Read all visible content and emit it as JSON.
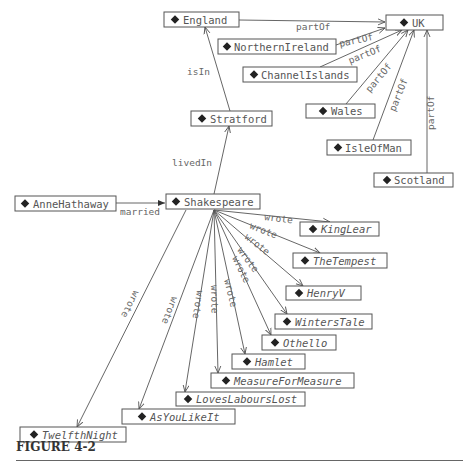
{
  "caption": "FIGURE 4-2",
  "nodes": {
    "england": {
      "label": "England",
      "x": 164,
      "y": 12,
      "w": 75,
      "h": 15
    },
    "uk": {
      "label": "UK",
      "x": 386,
      "y": 15,
      "w": 57,
      "h": 15
    },
    "northernireland": {
      "label": "NorthernIreland",
      "x": 218,
      "y": 39,
      "w": 118,
      "h": 15
    },
    "channelislands": {
      "label": "ChannelIslands",
      "x": 243,
      "y": 67,
      "w": 114,
      "h": 15
    },
    "wales": {
      "label": "Wales",
      "x": 306,
      "y": 104,
      "w": 69,
      "h": 14
    },
    "isleofman": {
      "label": "IsleOfMan",
      "x": 327,
      "y": 140,
      "w": 84,
      "h": 15
    },
    "scotland": {
      "label": "Scotland",
      "x": 374,
      "y": 173,
      "w": 79,
      "h": 14
    },
    "stratford": {
      "label": "Stratford",
      "x": 191,
      "y": 111,
      "w": 81,
      "h": 15
    },
    "annehathaway": {
      "label": "AnneHathaway",
      "x": 15,
      "y": 196,
      "w": 101,
      "h": 15
    },
    "shakespeare": {
      "label": "Shakespeare",
      "x": 166,
      "y": 194,
      "w": 94,
      "h": 15
    },
    "kinglear": {
      "label": "KingLear",
      "x": 300,
      "y": 222,
      "w": 79,
      "h": 14
    },
    "thetempest": {
      "label": "TheTempest",
      "x": 293,
      "y": 253,
      "w": 94,
      "h": 15
    },
    "henryv": {
      "label": "HenryV",
      "x": 286,
      "y": 286,
      "w": 75,
      "h": 14
    },
    "winterstale": {
      "label": "WintersTale",
      "x": 275,
      "y": 314,
      "w": 97,
      "h": 15
    },
    "othello": {
      "label": "Othello",
      "x": 262,
      "y": 335,
      "w": 74,
      "h": 15
    },
    "hamlet": {
      "label": "Hamlet",
      "x": 232,
      "y": 354,
      "w": 73,
      "h": 15
    },
    "measureformeasure": {
      "label": "MeasureForMeasure",
      "x": 211,
      "y": 373,
      "w": 143,
      "h": 15
    },
    "loveslabourslost": {
      "label": "LovesLaboursLost",
      "x": 176,
      "y": 392,
      "w": 129,
      "h": 14
    },
    "asyoulikeit": {
      "label": "AsYouLikeIt",
      "x": 122,
      "y": 409,
      "w": 113,
      "h": 15
    },
    "twelfthnight": {
      "label": "TwelfthNight",
      "x": 20,
      "y": 427,
      "w": 106,
      "h": 15
    }
  },
  "edges": [
    {
      "from": "england",
      "to": "uk",
      "label": "partOf"
    },
    {
      "from": "northernireland",
      "to": "uk",
      "label": "partOf"
    },
    {
      "from": "channelislands",
      "to": "uk",
      "label": "partOf"
    },
    {
      "from": "wales",
      "to": "uk",
      "label": "partOf"
    },
    {
      "from": "isleofman",
      "to": "uk",
      "label": "partOf"
    },
    {
      "from": "scotland",
      "to": "uk",
      "label": "partOf"
    },
    {
      "from": "stratford",
      "to": "england",
      "label": "isIn"
    },
    {
      "from": "shakespeare",
      "to": "stratford",
      "label": "livedIn"
    },
    {
      "from": "annehathaway",
      "to": "shakespeare",
      "label": "married"
    },
    {
      "from": "shakespeare",
      "to": "kinglear",
      "label": "wrote"
    },
    {
      "from": "shakespeare",
      "to": "thetempest",
      "label": "wrote"
    },
    {
      "from": "shakespeare",
      "to": "henryv",
      "label": "wrote"
    },
    {
      "from": "shakespeare",
      "to": "winterstale",
      "label": "wrote"
    },
    {
      "from": "shakespeare",
      "to": "othello",
      "label": "wrote"
    },
    {
      "from": "shakespeare",
      "to": "hamlet",
      "label": "wrote"
    },
    {
      "from": "shakespeare",
      "to": "measureformeasure",
      "label": "wrote"
    },
    {
      "from": "shakespeare",
      "to": "loveslabourslost",
      "label": "wrote"
    },
    {
      "from": "shakespeare",
      "to": "asyoulikeit",
      "label": "wrote"
    },
    {
      "from": "shakespeare",
      "to": "twelfthnight",
      "label": "wrote"
    }
  ]
}
